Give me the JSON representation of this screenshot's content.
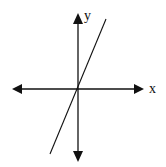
{
  "diagram": {
    "type": "coordinate-axes-with-line",
    "axes": {
      "x_label": "x",
      "y_label": "y",
      "origin_px": [
        78,
        89
      ],
      "x_axis_px": [
        12,
        143
      ],
      "y_axis_px": [
        14,
        161
      ],
      "arrows": "both ends"
    },
    "line": {
      "description": "straight line through origin with positive slope",
      "from_px": [
        50,
        154
      ],
      "to_px": [
        106,
        19
      ],
      "slope_sign": "positive",
      "passes_through_origin": true
    },
    "colors": {
      "stroke": "#111111",
      "background": "#ffffff"
    }
  }
}
